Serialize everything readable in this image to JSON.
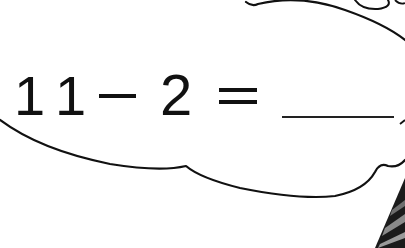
{
  "worksheet": {
    "equation": {
      "operand1": "11",
      "operator": "−",
      "operand2": "2",
      "equals": "=",
      "answer_blank": "______",
      "full_text": "11 − 2 = ______"
    },
    "bubble": {
      "shape": "thought-cloud",
      "outline_color": "#111111",
      "fill_color": "#ffffff"
    },
    "illustration": {
      "corner_element": "striped-sleeve",
      "colors": [
        "#1a1a1a",
        "#7a7a7a"
      ]
    }
  }
}
